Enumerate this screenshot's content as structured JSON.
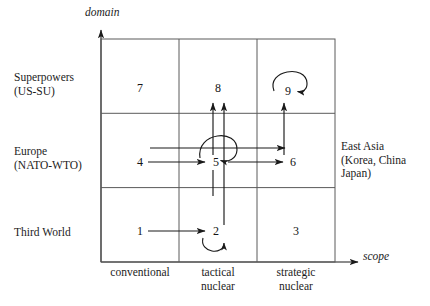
{
  "figure": {
    "axes": {
      "y_label": "domain",
      "x_label": "scope"
    },
    "row_labels": [
      "Superpowers\n(US-SU)",
      "Europe\n(NATO-WTO)",
      "Third World"
    ],
    "column_labels": [
      "conventional",
      "tactical\nnuclear",
      "strategic\nnuclear"
    ],
    "side_note": "East Asia\n(Korea, China\nJapan)",
    "cells": [
      {
        "id": "7",
        "label": "7",
        "row": "Superpowers (US-SU)",
        "col": "conventional"
      },
      {
        "id": "8",
        "label": "8",
        "row": "Superpowers (US-SU)",
        "col": "tactical nuclear"
      },
      {
        "id": "9",
        "label": "9",
        "row": "Superpowers (US-SU)",
        "col": "strategic nuclear"
      },
      {
        "id": "4",
        "label": "4",
        "row": "Europe (NATO-WTO)",
        "col": "conventional"
      },
      {
        "id": "5",
        "label": "5",
        "row": "Europe (NATO-WTO)",
        "col": "tactical nuclear"
      },
      {
        "id": "6",
        "label": "6",
        "row": "Europe (NATO-WTO)",
        "col": "strategic nuclear"
      },
      {
        "id": "1",
        "label": "1",
        "row": "Third World",
        "col": "conventional"
      },
      {
        "id": "2",
        "label": "2",
        "row": "Third World",
        "col": "tactical nuclear"
      },
      {
        "id": "3",
        "label": "3",
        "row": "Third World",
        "col": "strategic nuclear"
      }
    ],
    "arrows": [
      {
        "from": "1",
        "to": "2",
        "kind": "horizontal"
      },
      {
        "from": "4",
        "to": "5",
        "kind": "horizontal"
      },
      {
        "from": "5",
        "to": "6",
        "kind": "horizontal"
      },
      {
        "from": "5",
        "to": "8",
        "kind": "vertical"
      },
      {
        "from": "2",
        "to": "8",
        "kind": "vertical"
      },
      {
        "from": "6",
        "to": "9",
        "kind": "vertical"
      },
      {
        "from": "4",
        "to": "5",
        "kind": "horizontal-upper-return"
      },
      {
        "from": "2",
        "to": "2",
        "kind": "self-loop"
      },
      {
        "from": "5",
        "to": "5",
        "kind": "self-loop"
      },
      {
        "from": "9",
        "to": "9",
        "kind": "self-loop"
      }
    ],
    "colors": {
      "ink": "#1a1a1a",
      "grid": "#555555",
      "background": "#ffffff"
    }
  }
}
